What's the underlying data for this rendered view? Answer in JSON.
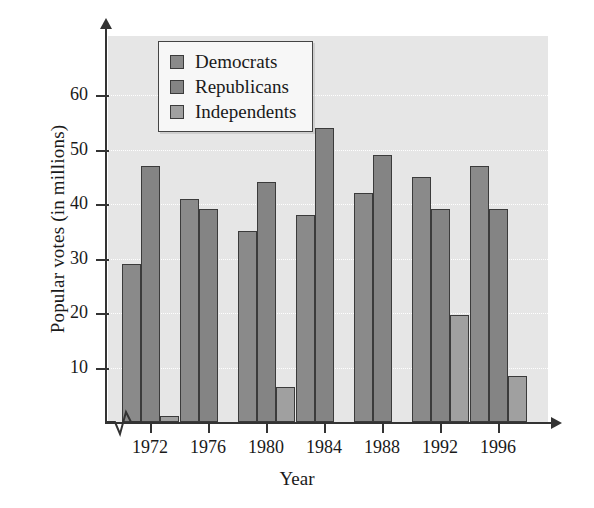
{
  "chart_data": {
    "type": "bar",
    "title": "",
    "xlabel": "Year",
    "ylabel": "Popular votes (in millions)",
    "categories": [
      "1972",
      "1976",
      "1980",
      "1984",
      "1988",
      "1992",
      "1996"
    ],
    "series": [
      {
        "name": "Democrats",
        "color": "#8a8a8a",
        "values": [
          29,
          41,
          35,
          38,
          42,
          45,
          47
        ]
      },
      {
        "name": "Republicans",
        "color": "#848484",
        "values": [
          47,
          39,
          44,
          54,
          49,
          39,
          39
        ]
      },
      {
        "name": "Independents",
        "color": "#a0a0a0",
        "values": [
          1.1,
          0,
          6.5,
          0,
          0,
          19.7,
          8.5
        ]
      }
    ],
    "ylim": [
      0,
      65
    ],
    "yticks": [
      10,
      20,
      30,
      40,
      50,
      60
    ],
    "ytick_labels": [
      "10",
      "20",
      "30",
      "40",
      "50",
      "60"
    ],
    "grid": true,
    "grid_color": "#ffffff",
    "plot_background": "#e6e6e6",
    "axis_color": "#333333",
    "axis_break": true,
    "legend": {
      "position": "top-left-inside",
      "entries": [
        "Democrats",
        "Republicans",
        "Independents"
      ]
    }
  }
}
